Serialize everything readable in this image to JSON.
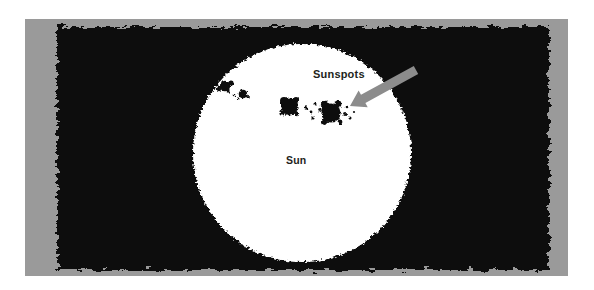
{
  "figure": {
    "medium": "black ink drawing on gray paper",
    "canvas": {
      "width": 594,
      "height": 290,
      "background": "#ffffff"
    },
    "panel": {
      "name": "gray-paper-panel",
      "color": "#9a9a9a",
      "x": 25,
      "y": 19,
      "width": 543,
      "height": 257
    },
    "ink": {
      "name": "black-ink-field",
      "color": "#0d0d0d",
      "x": 57,
      "y": 27,
      "width": 492,
      "height": 243,
      "edge_style": "ragged hand-drawn crayon texture"
    }
  },
  "sun": {
    "name": "sun-disc",
    "color": "#ffffff",
    "center_x": 302,
    "center_y": 153,
    "radius": 109,
    "label": "Sun",
    "label_x": 286,
    "label_y": 155
  },
  "annotation": {
    "sunspots_label": "Sunspots",
    "sunspots_label_x": 313,
    "sunspots_label_y": 69,
    "arrow": {
      "name": "pointer-arrow",
      "color": "#8c8c8c",
      "tip_x": 350,
      "tip_y": 106,
      "tail_x": 416,
      "tail_y": 70,
      "angle_deg": 209
    }
  },
  "sunspot_groups": [
    {
      "name": "upper-left-group",
      "spots": [
        {
          "cx": 225,
          "cy": 86,
          "r": 5.2
        },
        {
          "cx": 231,
          "cy": 83,
          "r": 2.6
        },
        {
          "cx": 219,
          "cy": 89,
          "r": 2.2
        },
        {
          "cx": 228,
          "cy": 91,
          "r": 1.7
        },
        {
          "cx": 234,
          "cy": 95,
          "r": 1.3
        },
        {
          "cx": 243,
          "cy": 94,
          "r": 4.3
        },
        {
          "cx": 248,
          "cy": 97,
          "r": 1.9
        },
        {
          "cx": 238,
          "cy": 99,
          "r": 1.4
        }
      ]
    },
    {
      "name": "central-main-group",
      "spots": [
        {
          "cx": 290,
          "cy": 107,
          "r": 8.5
        },
        {
          "cx": 284,
          "cy": 101,
          "r": 4.0
        },
        {
          "cx": 296,
          "cy": 100,
          "r": 3.0
        },
        {
          "cx": 282,
          "cy": 113,
          "r": 2.6
        },
        {
          "cx": 297,
          "cy": 114,
          "r": 2.2
        },
        {
          "cx": 306,
          "cy": 108,
          "r": 1.8
        },
        {
          "cx": 311,
          "cy": 112,
          "r": 1.4
        },
        {
          "cx": 315,
          "cy": 104,
          "r": 1.5
        },
        {
          "cx": 320,
          "cy": 110,
          "r": 1.9
        },
        {
          "cx": 313,
          "cy": 118,
          "r": 1.6
        },
        {
          "cx": 331,
          "cy": 113,
          "r": 9.6
        },
        {
          "cx": 325,
          "cy": 105,
          "r": 4.2
        },
        {
          "cx": 338,
          "cy": 104,
          "r": 3.4
        },
        {
          "cx": 324,
          "cy": 122,
          "r": 3.0
        },
        {
          "cx": 340,
          "cy": 122,
          "r": 2.4
        },
        {
          "cx": 345,
          "cy": 114,
          "r": 2.0
        },
        {
          "cx": 350,
          "cy": 118,
          "r": 1.5
        },
        {
          "cx": 347,
          "cy": 107,
          "r": 1.3
        },
        {
          "cx": 354,
          "cy": 112,
          "r": 1.1
        }
      ]
    }
  ]
}
